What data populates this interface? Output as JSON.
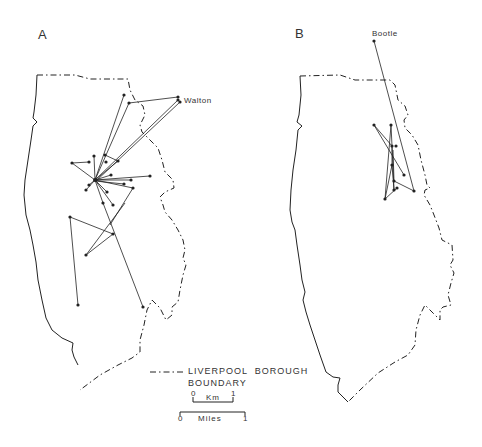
{
  "panels": [
    {
      "label": "A",
      "place_label": "Walton"
    },
    {
      "label": "B",
      "place_label": "Bootle"
    }
  ],
  "legend": {
    "line1": "LIVERPOOL  BOROUGH",
    "line2": "BOUNDARY"
  },
  "scale": {
    "km_zero": "0",
    "km_label": "Km",
    "km_one": "1",
    "miles_zero": "0",
    "miles_label": "Miles",
    "miles_one": "1"
  },
  "colors": {
    "ink": "#222222",
    "background": "#ffffff"
  }
}
